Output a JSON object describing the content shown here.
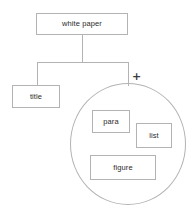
{
  "diagram": {
    "type": "tree-with-group",
    "colors": {
      "stroke": "#b3b3b3",
      "text": "#2b2b2b",
      "background": "#ffffff",
      "marker": "#3a3a3a"
    },
    "nodes": [
      {
        "id": "white-paper",
        "label": "white paper",
        "shape": "rect",
        "level": 0
      },
      {
        "id": "title",
        "label": "title",
        "shape": "rect",
        "level": 1
      },
      {
        "id": "para",
        "label": "para",
        "shape": "rect",
        "level": 2
      },
      {
        "id": "list",
        "label": "list",
        "shape": "rect",
        "level": 2
      },
      {
        "id": "figure",
        "label": "figure",
        "shape": "rect",
        "level": 2
      }
    ],
    "groups": [
      {
        "id": "choice-group",
        "shape": "circle",
        "marker": "+",
        "members": [
          "para",
          "list",
          "figure"
        ]
      }
    ],
    "edges": [
      {
        "from": "white-paper",
        "to": "title"
      },
      {
        "from": "white-paper",
        "to": "choice-group"
      }
    ]
  }
}
